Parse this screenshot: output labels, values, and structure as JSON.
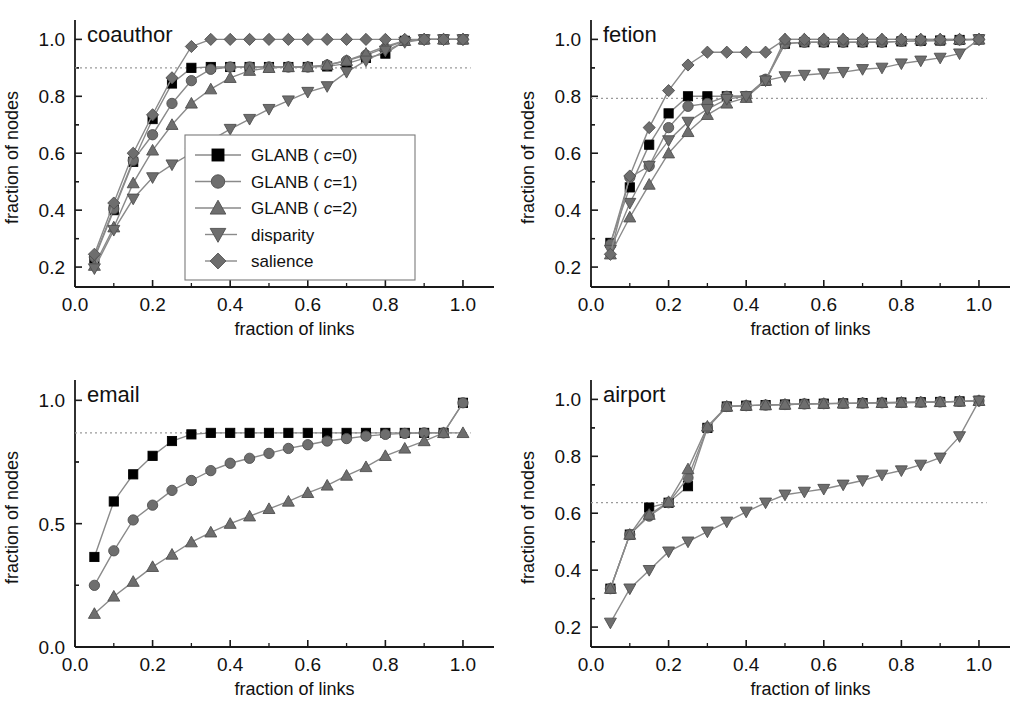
{
  "figure": {
    "background": "#ffffff",
    "panel_count": 4
  },
  "style": {
    "color_black": "#000000",
    "color_gray": "#6e6e6e",
    "color_line": "#8a8a8a",
    "color_axis": "#1a1a1a",
    "color_dotted": "#9a9a9a"
  },
  "legend": {
    "position": "inside-panel-coauthor-lower-right",
    "border": true,
    "entries": [
      {
        "label_prefix": "GLANB",
        "label_paren_open": "(",
        "param": "c",
        "eq_value": "=0)",
        "marker": "square",
        "color": "#000000"
      },
      {
        "label_prefix": "GLANB",
        "label_paren_open": "(",
        "param": "c",
        "eq_value": "=1)",
        "marker": "circle",
        "color": "#6e6e6e"
      },
      {
        "label_prefix": "GLANB",
        "label_paren_open": "(",
        "param": "c",
        "eq_value": "=2)",
        "marker": "triangle-up",
        "color": "#6e6e6e"
      },
      {
        "label_prefix": "disparity",
        "label_paren_open": "",
        "param": "",
        "eq_value": "",
        "marker": "triangle-down",
        "color": "#6e6e6e"
      },
      {
        "label_prefix": "salience",
        "label_paren_open": "",
        "param": "",
        "eq_value": "",
        "marker": "diamond",
        "color": "#6e6e6e"
      }
    ]
  },
  "chart_data": [
    {
      "id": "coauthor",
      "type": "line",
      "title": "coauthor",
      "xlabel": "fraction of  links",
      "ylabel": "fraction of nodes",
      "xlim": [
        0.0,
        1.08
      ],
      "ylim": [
        0.13,
        1.04
      ],
      "xticks": [
        0.0,
        0.2,
        0.4,
        0.6,
        0.8,
        1.0
      ],
      "xticklabels": [
        "0.0",
        "0.2",
        "0.4",
        "0.6",
        "0.8",
        "1.0"
      ],
      "yticks": [
        0.2,
        0.4,
        0.6,
        0.8,
        1.0
      ],
      "yticklabels": [
        "0.2",
        "0.4",
        "0.6",
        "0.8",
        "1.0"
      ],
      "grid": false,
      "reference_line": {
        "y": 0.9,
        "style": "dotted",
        "x_from": 0.0,
        "x_to": 1.02
      },
      "x": [
        0.05,
        0.1,
        0.15,
        0.2,
        0.25,
        0.3,
        0.35,
        0.4,
        0.45,
        0.5,
        0.55,
        0.6,
        0.65,
        0.7,
        0.75,
        0.8,
        0.85,
        0.9,
        0.95,
        1.0
      ],
      "series": [
        {
          "name": "GLANB ( c=0)",
          "marker": "square",
          "color": "#000000",
          "values": [
            0.23,
            0.4,
            0.57,
            0.72,
            0.845,
            0.9,
            0.903,
            0.903,
            0.903,
            0.903,
            0.903,
            0.903,
            0.905,
            0.915,
            0.935,
            0.95,
            0.995,
            1.0,
            1.0,
            1.0
          ]
        },
        {
          "name": "GLANB ( c=1)",
          "marker": "circle",
          "color": "#6e6e6e",
          "values": [
            0.235,
            0.405,
            0.575,
            0.665,
            0.775,
            0.855,
            0.895,
            0.903,
            0.903,
            0.903,
            0.903,
            0.903,
            0.91,
            0.925,
            0.945,
            0.97,
            0.995,
            1.0,
            1.0,
            1.0
          ]
        },
        {
          "name": "GLANB ( c=2)",
          "marker": "triangle-up",
          "color": "#6e6e6e",
          "values": [
            0.205,
            0.34,
            0.495,
            0.61,
            0.7,
            0.775,
            0.825,
            0.865,
            0.89,
            0.9,
            0.903,
            0.903,
            0.91,
            0.925,
            0.95,
            0.975,
            0.995,
            1.0,
            1.0,
            1.0
          ]
        },
        {
          "name": "disparity",
          "marker": "triangle-down",
          "color": "#6e6e6e",
          "values": [
            0.195,
            0.33,
            0.44,
            0.515,
            0.56,
            0.6,
            0.645,
            0.685,
            0.72,
            0.755,
            0.785,
            0.815,
            0.835,
            0.885,
            0.925,
            0.96,
            0.99,
            1.0,
            1.0,
            1.0
          ]
        },
        {
          "name": "salience",
          "marker": "diamond",
          "color": "#6e6e6e",
          "values": [
            0.245,
            0.425,
            0.6,
            0.735,
            0.865,
            0.975,
            1.0,
            1.0,
            1.0,
            1.0,
            1.0,
            1.0,
            1.0,
            1.0,
            1.0,
            1.0,
            1.0,
            1.0,
            1.0,
            1.0
          ]
        }
      ]
    },
    {
      "id": "fetion",
      "type": "line",
      "title": "fetion",
      "xlabel": "fraction of links",
      "ylabel": "fraction of nodes",
      "xlim": [
        0.0,
        1.08
      ],
      "ylim": [
        0.13,
        1.04
      ],
      "xticks": [
        0.0,
        0.2,
        0.4,
        0.6,
        0.8,
        1.0
      ],
      "xticklabels": [
        "0.0",
        "0.2",
        "0.4",
        "0.6",
        "0.8",
        "1.0"
      ],
      "yticks": [
        0.2,
        0.4,
        0.6,
        0.8,
        1.0
      ],
      "yticklabels": [
        "0.2",
        "0.4",
        "0.6",
        "0.8",
        "1.0"
      ],
      "grid": false,
      "reference_line": {
        "y": 0.793,
        "style": "dotted",
        "x_from": 0.0,
        "x_to": 1.02
      },
      "x": [
        0.05,
        0.1,
        0.15,
        0.2,
        0.25,
        0.3,
        0.35,
        0.4,
        0.45,
        0.5,
        0.55,
        0.6,
        0.65,
        0.7,
        0.75,
        0.8,
        0.85,
        0.9,
        0.95,
        1.0
      ],
      "series": [
        {
          "name": "GLANB ( c=0)",
          "marker": "square",
          "color": "#000000",
          "values": [
            0.285,
            0.48,
            0.63,
            0.74,
            0.8,
            0.8,
            0.8,
            0.8,
            0.855,
            0.985,
            0.99,
            0.99,
            0.99,
            0.99,
            0.99,
            0.993,
            0.995,
            0.996,
            0.998,
            1.0
          ]
        },
        {
          "name": "GLANB ( c=1)",
          "marker": "circle",
          "color": "#6e6e6e",
          "values": [
            0.28,
            0.515,
            0.555,
            0.69,
            0.765,
            0.775,
            0.8,
            0.8,
            0.86,
            0.985,
            0.99,
            0.99,
            0.99,
            0.99,
            0.99,
            0.993,
            0.995,
            0.996,
            0.998,
            1.0
          ]
        },
        {
          "name": "GLANB ( c=2)",
          "marker": "triangle-up",
          "color": "#6e6e6e",
          "values": [
            0.245,
            0.375,
            0.49,
            0.6,
            0.675,
            0.735,
            0.775,
            0.795,
            0.855,
            1.0,
            1.0,
            1.0,
            1.0,
            1.0,
            1.0,
            1.0,
            1.0,
            1.0,
            1.0,
            1.0
          ]
        },
        {
          "name": "disparity",
          "marker": "triangle-down",
          "color": "#6e6e6e",
          "values": [
            0.26,
            0.425,
            0.555,
            0.645,
            0.71,
            0.755,
            0.79,
            0.8,
            0.855,
            0.87,
            0.875,
            0.88,
            0.885,
            0.895,
            0.9,
            0.915,
            0.925,
            0.935,
            0.95,
            1.0
          ]
        },
        {
          "name": "salience",
          "marker": "diamond",
          "color": "#6e6e6e",
          "values": [
            0.245,
            0.52,
            0.69,
            0.82,
            0.91,
            0.955,
            0.955,
            0.955,
            0.955,
            1.0,
            1.0,
            1.0,
            1.0,
            1.0,
            1.0,
            1.0,
            1.0,
            1.0,
            1.0,
            1.0
          ]
        }
      ]
    },
    {
      "id": "email",
      "type": "line",
      "title": "email",
      "xlabel": "fraction of links",
      "ylabel": "fraction of nodes",
      "xlim": [
        0.0,
        1.08
      ],
      "ylim": [
        0.0,
        1.05
      ],
      "xticks": [
        0.0,
        0.2,
        0.4,
        0.6,
        0.8,
        1.0
      ],
      "xticklabels": [
        "0.0",
        "0.2",
        "0.4",
        "0.6",
        "0.8",
        "1.0"
      ],
      "yticks": [
        0.0,
        0.5,
        1.0
      ],
      "yticklabels": [
        "0.0",
        "0.5",
        "1.0"
      ],
      "grid": false,
      "reference_line": {
        "y": 0.868,
        "style": "dotted",
        "x_from": 0.0,
        "x_to": 1.02
      },
      "x": [
        0.05,
        0.1,
        0.15,
        0.2,
        0.25,
        0.3,
        0.35,
        0.4,
        0.45,
        0.5,
        0.55,
        0.6,
        0.65,
        0.7,
        0.75,
        0.8,
        0.85,
        0.9,
        0.95,
        1.0
      ],
      "series": [
        {
          "name": "GLANB ( c=0)",
          "marker": "square",
          "color": "#000000",
          "values": [
            0.365,
            0.59,
            0.7,
            0.775,
            0.835,
            0.862,
            0.868,
            0.868,
            0.868,
            0.868,
            0.868,
            0.868,
            0.868,
            0.868,
            0.868,
            0.868,
            0.868,
            0.868,
            0.868,
            0.99
          ]
        },
        {
          "name": "GLANB ( c=1)",
          "marker": "circle",
          "color": "#6e6e6e",
          "values": [
            0.25,
            0.39,
            0.515,
            0.575,
            0.635,
            0.675,
            0.715,
            0.745,
            0.765,
            0.785,
            0.805,
            0.82,
            0.835,
            0.845,
            0.855,
            0.862,
            0.866,
            0.868,
            0.868,
            0.99
          ]
        },
        {
          "name": "GLANB ( c=2)",
          "marker": "triangle-up",
          "color": "#6e6e6e",
          "values": [
            0.135,
            0.205,
            0.265,
            0.325,
            0.375,
            0.425,
            0.465,
            0.5,
            0.53,
            0.56,
            0.59,
            0.625,
            0.655,
            0.695,
            0.73,
            0.775,
            0.805,
            0.835,
            0.868,
            0.868
          ]
        }
      ]
    },
    {
      "id": "airport",
      "type": "line",
      "title": "airport",
      "xlabel": "fraction of links",
      "ylabel": "fraction of nodes",
      "xlim": [
        0.0,
        1.08
      ],
      "ylim": [
        0.13,
        1.04
      ],
      "xticks": [
        0.0,
        0.2,
        0.4,
        0.6,
        0.8,
        1.0
      ],
      "xticklabels": [
        "0.0",
        "0.2",
        "0.4",
        "0.6",
        "0.8",
        "1.0"
      ],
      "yticks": [
        0.2,
        0.4,
        0.6,
        0.8,
        1.0
      ],
      "yticklabels": [
        "0.2",
        "0.4",
        "0.6",
        "0.8",
        "1.0"
      ],
      "grid": false,
      "reference_line": {
        "y": 0.637,
        "style": "dotted",
        "x_from": 0.0,
        "x_to": 1.02
      },
      "x": [
        0.05,
        0.1,
        0.15,
        0.2,
        0.25,
        0.3,
        0.35,
        0.4,
        0.45,
        0.5,
        0.55,
        0.6,
        0.65,
        0.7,
        0.75,
        0.8,
        0.85,
        0.9,
        0.95,
        1.0
      ],
      "series": [
        {
          "name": "GLANB ( c=0)",
          "marker": "square",
          "color": "#000000",
          "values": [
            0.335,
            0.525,
            0.62,
            0.637,
            0.695,
            0.9,
            0.975,
            0.978,
            0.98,
            0.982,
            0.984,
            0.985,
            0.986,
            0.987,
            0.988,
            0.989,
            0.99,
            0.991,
            0.993,
            0.995
          ]
        },
        {
          "name": "GLANB ( c=1)",
          "marker": "circle",
          "color": "#6e6e6e",
          "values": [
            0.335,
            0.525,
            0.59,
            0.637,
            0.725,
            0.9,
            0.975,
            0.978,
            0.98,
            0.982,
            0.984,
            0.985,
            0.986,
            0.987,
            0.988,
            0.989,
            0.99,
            0.991,
            0.993,
            0.995
          ]
        },
        {
          "name": "GLANB ( c=2)",
          "marker": "triangle-up",
          "color": "#6e6e6e",
          "values": [
            0.335,
            0.525,
            0.595,
            0.64,
            0.755,
            0.905,
            0.975,
            0.978,
            0.98,
            0.982,
            0.984,
            0.985,
            0.986,
            0.987,
            0.988,
            0.989,
            0.99,
            0.991,
            0.993,
            0.995
          ]
        },
        {
          "name": "disparity",
          "marker": "triangle-down",
          "color": "#6e6e6e",
          "values": [
            0.215,
            0.335,
            0.4,
            0.465,
            0.5,
            0.535,
            0.57,
            0.605,
            0.637,
            0.665,
            0.675,
            0.685,
            0.7,
            0.715,
            0.735,
            0.75,
            0.77,
            0.795,
            0.87,
            0.995
          ]
        }
      ]
    }
  ]
}
